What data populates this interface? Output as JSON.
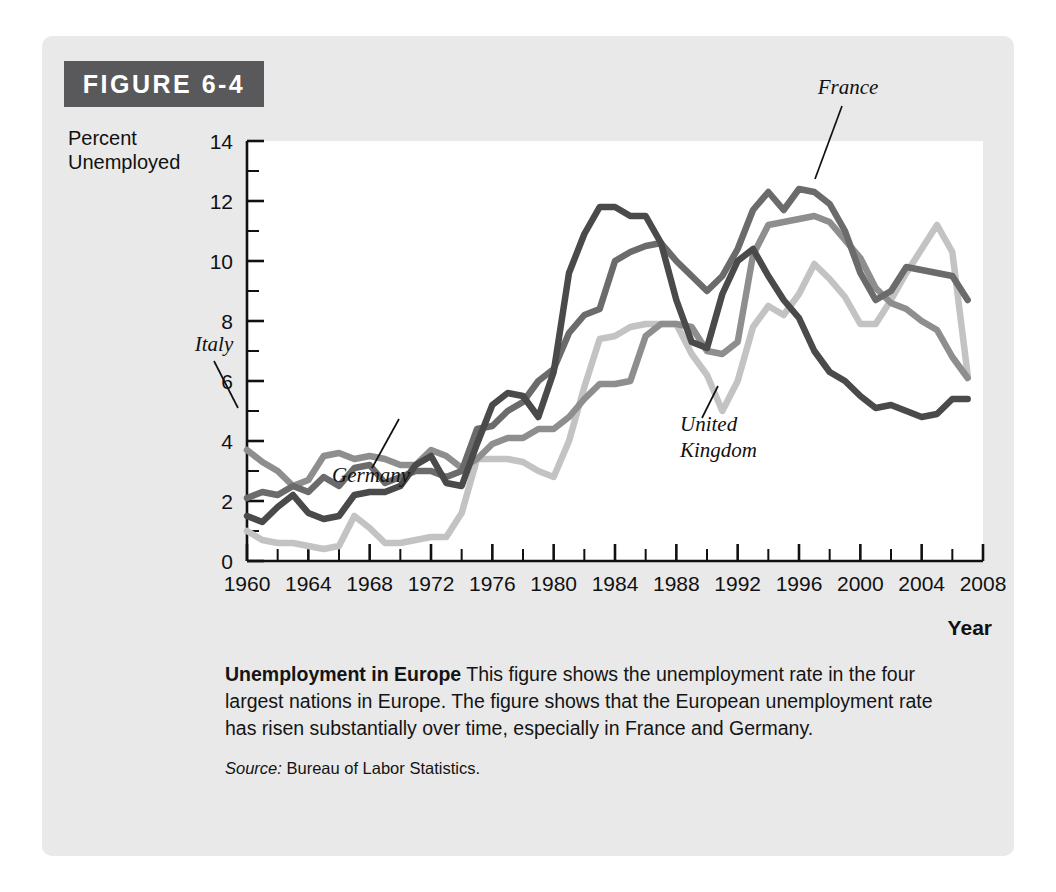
{
  "figure": {
    "badge_label": "FIGURE 6-4",
    "y_axis_title": "Percent\nUnemployed",
    "x_axis_title": "Year"
  },
  "caption": {
    "title": "Unemployment in Europe",
    "body": " This figure shows the unemployment rate in the four largest nations in Europe. The figure shows that the European unemployment rate has risen substantially over time, especially in France and Germany.",
    "source_label": "Source:",
    "source_text": " Bureau of Labor Statistics."
  },
  "colors": {
    "panel_background": "#e9e9e9",
    "badge_background": "#59595b",
    "plot_background": "#ffffff",
    "axis": "#111111",
    "united_kingdom": "#4a4a4a",
    "france": "#6b6b6b",
    "italy": "#8e8e8e",
    "germany": "#c3c3c3"
  },
  "chart_data": {
    "type": "line",
    "title": "Unemployment in Europe",
    "xlabel": "Year",
    "ylabel": "Percent Unemployed",
    "xlim": [
      1960,
      2008
    ],
    "ylim": [
      0,
      14
    ],
    "xticks": [
      1960,
      1964,
      1968,
      1972,
      1976,
      1980,
      1984,
      1988,
      1992,
      1996,
      2000,
      2004,
      2008
    ],
    "xtick_labels": [
      "1960",
      "1964",
      "1968",
      "1972",
      "1976",
      "1980",
      "1984",
      "1988",
      "1992",
      "1996",
      "2000",
      "2004",
      "2008"
    ],
    "x_minor_step": 2,
    "yticks": [
      0,
      2,
      4,
      6,
      8,
      10,
      12,
      14
    ],
    "ytick_labels": [
      "0",
      "2",
      "4",
      "6",
      "8",
      "10",
      "12",
      "14"
    ],
    "y_minor_step": 1,
    "grid": false,
    "legend_position": "inline-annotations",
    "x": [
      1960,
      1961,
      1962,
      1963,
      1964,
      1965,
      1966,
      1967,
      1968,
      1969,
      1970,
      1971,
      1972,
      1973,
      1974,
      1975,
      1976,
      1977,
      1978,
      1979,
      1980,
      1981,
      1982,
      1983,
      1984,
      1985,
      1986,
      1987,
      1988,
      1989,
      1990,
      1991,
      1992,
      1993,
      1994,
      1995,
      1996,
      1997,
      1998,
      1999,
      2000,
      2001,
      2002,
      2003,
      2004,
      2005,
      2006,
      2007
    ],
    "series": [
      {
        "name": "France",
        "color": "#6b6b6b",
        "label_text": "France",
        "values": [
          2.1,
          2.3,
          2.2,
          2.5,
          2.3,
          2.8,
          2.5,
          3.1,
          3.2,
          2.6,
          2.8,
          3.0,
          3.0,
          2.8,
          3.0,
          4.4,
          4.5,
          5.0,
          5.3,
          6.0,
          6.4,
          7.6,
          8.2,
          8.4,
          10.0,
          10.3,
          10.5,
          10.6,
          10.0,
          9.5,
          9.0,
          9.5,
          10.4,
          11.7,
          12.3,
          11.7,
          12.4,
          12.3,
          11.9,
          11.0,
          9.6,
          8.7,
          9.0,
          9.8,
          9.7,
          9.6,
          9.5,
          8.7
        ]
      },
      {
        "name": "Germany",
        "color": "#c3c3c3",
        "label_text": "Germany",
        "values": [
          1.0,
          0.7,
          0.6,
          0.6,
          0.5,
          0.4,
          0.5,
          1.5,
          1.1,
          0.6,
          0.6,
          0.7,
          0.8,
          0.8,
          1.6,
          3.4,
          3.4,
          3.4,
          3.3,
          3.0,
          2.8,
          4.0,
          5.8,
          7.4,
          7.5,
          7.8,
          7.9,
          7.9,
          7.9,
          6.9,
          6.2,
          5.0,
          6.0,
          7.8,
          8.5,
          8.2,
          8.9,
          9.9,
          9.4,
          8.8,
          7.9,
          7.9,
          8.7,
          9.6,
          10.4,
          11.2,
          10.3,
          6.2
        ]
      },
      {
        "name": "Italy",
        "color": "#8e8e8e",
        "label_text": "Italy",
        "values": [
          3.7,
          3.3,
          3.0,
          2.5,
          2.7,
          3.5,
          3.6,
          3.4,
          3.5,
          3.4,
          3.2,
          3.2,
          3.7,
          3.5,
          3.1,
          3.4,
          3.9,
          4.1,
          4.1,
          4.4,
          4.4,
          4.8,
          5.4,
          5.9,
          5.9,
          6.0,
          7.5,
          7.9,
          7.9,
          7.8,
          7.0,
          6.9,
          7.3,
          10.2,
          11.2,
          11.3,
          11.4,
          11.5,
          11.3,
          10.7,
          10.1,
          9.1,
          8.6,
          8.4,
          8.0,
          7.7,
          6.8,
          6.1
        ]
      },
      {
        "name": "United Kingdom",
        "color": "#4a4a4a",
        "label_text": "United\nKingdom",
        "values": [
          1.5,
          1.3,
          1.8,
          2.2,
          1.6,
          1.4,
          1.5,
          2.2,
          2.3,
          2.3,
          2.5,
          3.2,
          3.5,
          2.6,
          2.5,
          3.9,
          5.2,
          5.6,
          5.5,
          4.8,
          6.3,
          9.6,
          10.9,
          11.8,
          11.8,
          11.5,
          11.5,
          10.6,
          8.7,
          7.3,
          7.1,
          8.9,
          10.0,
          10.4,
          9.5,
          8.7,
          8.1,
          7.0,
          6.3,
          6.0,
          5.5,
          5.1,
          5.2,
          5.0,
          4.8,
          4.9,
          5.4,
          5.4
        ]
      }
    ],
    "annotations": [
      {
        "text": "France",
        "series": "France",
        "point_year": 1996,
        "point_value": 12.4
      },
      {
        "text": "Italy",
        "series": "Italy",
        "point_year": 1965,
        "point_value": 3.5
      },
      {
        "text": "Germany",
        "series": "Germany",
        "point_year": 1977,
        "point_value": 3.4
      },
      {
        "text": "United Kingdom",
        "series": "United Kingdom",
        "point_year": 2000,
        "point_value": 5.5
      }
    ]
  }
}
